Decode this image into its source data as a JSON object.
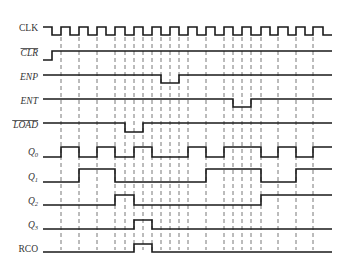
{
  "diagram": {
    "type": "timing-diagram",
    "x_start": 43,
    "x_end": 332,
    "clock_period": 18.2,
    "colors": {
      "wave": "#1a1a1a",
      "dash": "#555555",
      "label": "#333333"
    },
    "dashed_lines": [
      61,
      79,
      97,
      115,
      125,
      134,
      143,
      152,
      161,
      170,
      179,
      188,
      206,
      224,
      233,
      242,
      251,
      261,
      278,
      296,
      313
    ],
    "dash_y_top": 37,
    "dash_y_bottom": 250,
    "signals": [
      {
        "id": "clk",
        "label": "CLK",
        "italic": false,
        "overbar": false,
        "subscript": "",
        "label_y": 31,
        "high_y": 27,
        "low_y": 35,
        "initial": "high",
        "transitions": [
          52,
          61,
          70,
          79,
          88,
          97,
          106,
          115,
          125,
          134,
          143,
          152,
          161,
          170,
          179,
          188,
          197,
          206,
          215,
          224,
          233,
          242,
          251,
          261,
          270,
          278,
          288,
          296,
          305,
          313,
          323
        ],
        "end_x": 332
      },
      {
        "id": "clr",
        "label": "CLR",
        "italic": true,
        "overbar": true,
        "subscript": "",
        "label_y": 56,
        "high_y": 51,
        "low_y": 60,
        "initial": "low",
        "transitions": [
          52
        ],
        "end_x": 332
      },
      {
        "id": "enp",
        "label": "ENP",
        "italic": true,
        "overbar": false,
        "subscript": "",
        "label_y": 80,
        "high_y": 75,
        "low_y": 83,
        "initial": "high",
        "transitions": [
          161,
          179
        ],
        "end_x": 332
      },
      {
        "id": "ent",
        "label": "ENT",
        "italic": true,
        "overbar": false,
        "subscript": "",
        "label_y": 104,
        "high_y": 99,
        "low_y": 107,
        "initial": "high",
        "transitions": [
          233,
          251
        ],
        "end_x": 332
      },
      {
        "id": "load",
        "label": "LOAD",
        "italic": true,
        "overbar": true,
        "subscript": "",
        "label_y": 128,
        "high_y": 123,
        "low_y": 132,
        "initial": "high",
        "transitions": [
          125,
          143
        ],
        "end_x": 332
      },
      {
        "id": "q0",
        "label": "Q",
        "italic": true,
        "overbar": false,
        "subscript": "0",
        "label_y": 155,
        "high_y": 147,
        "low_y": 157,
        "initial": "low",
        "transitions": [
          61,
          79,
          97,
          115,
          134,
          152,
          188,
          206,
          224,
          261,
          278,
          296,
          313
        ],
        "end_x": 332
      },
      {
        "id": "q1",
        "label": "Q",
        "italic": true,
        "overbar": false,
        "subscript": "1",
        "label_y": 180,
        "high_y": 169,
        "low_y": 182,
        "initial": "low",
        "transitions": [
          79,
          115,
          206,
          261,
          296
        ],
        "end_x": 332
      },
      {
        "id": "q2",
        "label": "Q",
        "italic": true,
        "overbar": false,
        "subscript": "2",
        "label_y": 204,
        "high_y": 195,
        "low_y": 205,
        "initial": "low",
        "transitions": [
          115,
          134,
          261
        ],
        "end_x": 332
      },
      {
        "id": "q3",
        "label": "Q",
        "italic": true,
        "overbar": false,
        "subscript": "3",
        "label_y": 228,
        "high_y": 220,
        "low_y": 229,
        "initial": "low",
        "transitions": [
          134,
          152
        ],
        "end_x": 332
      },
      {
        "id": "rco",
        "label": "RCO",
        "italic": false,
        "overbar": false,
        "subscript": "",
        "label_y": 252,
        "high_y": 244,
        "low_y": 252,
        "initial": "low",
        "transitions": [
          134,
          152
        ],
        "end_x": 332
      }
    ]
  }
}
